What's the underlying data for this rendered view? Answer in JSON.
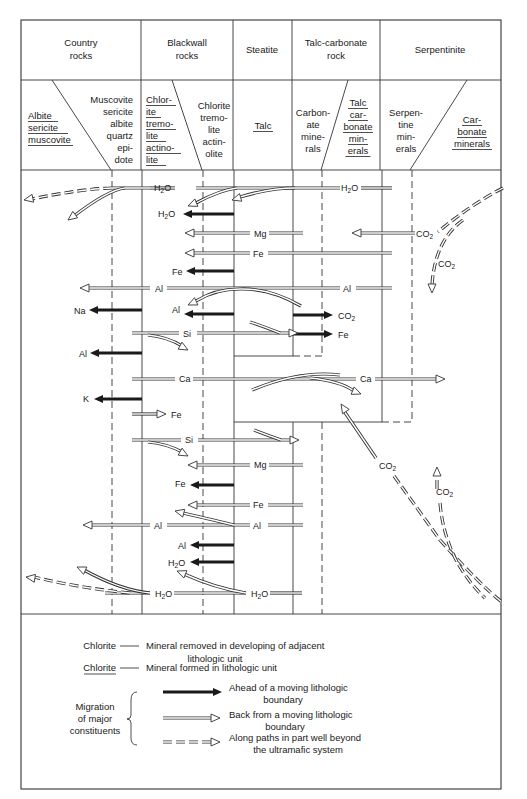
{
  "header": {
    "zones": [
      {
        "id": "country",
        "title": [
          "Country",
          "rocks"
        ]
      },
      {
        "id": "blackwall",
        "title": [
          "Blackwall",
          "rocks"
        ]
      },
      {
        "id": "steatite",
        "title": [
          "Steatite"
        ]
      },
      {
        "id": "talc_carbonate",
        "title": [
          "Talc-carbonate",
          "rock"
        ]
      },
      {
        "id": "serpentinite",
        "title": [
          "Serpentinite"
        ]
      }
    ],
    "minerals": {
      "country_left": {
        "lines": [
          "Albite",
          "sericite",
          "muscovite"
        ],
        "formed": true
      },
      "country_right": {
        "lines": [
          "Muscovite",
          "sericite",
          "albite",
          "quartz",
          "epi-",
          "dote"
        ],
        "formed": false
      },
      "blackwall_left": {
        "lines": [
          "Chlor-",
          "ite",
          "tremo-",
          "lite",
          "actino-",
          "lite"
        ],
        "formed": true
      },
      "blackwall_right": {
        "lines": [
          "Chlorite",
          "tremo-",
          "lite",
          "actin-",
          "olite"
        ],
        "formed": false
      },
      "steatite": {
        "lines": [
          "Talc"
        ],
        "formed": true
      },
      "talc_carb_left": {
        "lines": [
          "Carbon-",
          "ate",
          "mine-",
          "rals"
        ],
        "formed": false
      },
      "talc_carb_right": {
        "lines": [
          "Talc",
          "car-",
          "bonate",
          "min-",
          "erals"
        ],
        "formed": true
      },
      "serp_left": {
        "lines": [
          "Serpen-",
          "tine",
          "min-",
          "erals"
        ],
        "formed": false
      },
      "serp_right": {
        "lines": [
          "Car-",
          "bonate",
          "minerals"
        ],
        "formed": true
      }
    }
  },
  "migrations": {
    "h2o_top": "H2O",
    "h2o_top_right": "H2O",
    "h2o_blackwall": "H2O",
    "mg_top": "Mg",
    "co2_serp": "CO2",
    "co2_down": "CO2",
    "fe_top": "Fe",
    "fe_blackwall": "Fe",
    "al_top": "Al",
    "al_top_right": "Al",
    "na": "Na",
    "al_blackwall": "Al",
    "co2_steatite": "CO2",
    "si_top": "Si",
    "fe_steatite": "Fe",
    "al_country": "Al",
    "ca": "Ca",
    "ca_right": "Ca",
    "k": "K",
    "fe_country": "Fe",
    "si_bottom": "Si",
    "co2_mid": "CO2",
    "mg_bottom": "Mg",
    "fe_blackwall_2": "Fe",
    "co2_up": "CO2",
    "fe_bottom": "Fe",
    "al_bottom": "Al",
    "al_bottom_right": "Al",
    "al_blackwall_2": "Al",
    "h2o_blackwall_2": "H2O",
    "h2o_bottom": "H2O",
    "h2o_bottom_right": "H2O"
  },
  "legend": {
    "removed_term": "Chlorite",
    "removed_desc": [
      "Mineral removed in developing of adjacent",
      "lithologic unit"
    ],
    "formed_term": "Chlorite",
    "formed_desc": "Mineral formed in lithologic unit",
    "migration_label": [
      "Migration",
      "of major",
      "constituents"
    ],
    "ahead": [
      "Ahead of a moving lithologic",
      "boundary"
    ],
    "back": [
      "Back from a moving lithologic",
      "boundary"
    ],
    "along": [
      "Along paths in part well beyond",
      "the ultramafic system"
    ]
  }
}
